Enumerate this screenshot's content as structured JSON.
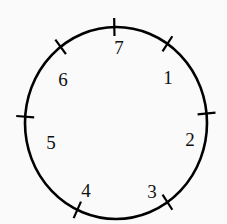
{
  "figure": {
    "type": "labeled-circle-diagram",
    "background_color": "#fafafa",
    "stroke_color": "#000000",
    "label_color": "#101010",
    "circle": {
      "center_x": 116,
      "center_y": 123,
      "radius_x": 91,
      "radius_y": 96,
      "stroke_width": 2.6
    },
    "tick": {
      "inner_offset": -9,
      "outer_offset": 9,
      "stroke_width": 2.2
    },
    "label_inset": 26,
    "marks": [
      {
        "id": "mark-1",
        "label": "1",
        "angle_deg": 57,
        "label_x": 168,
        "label_y": 77
      },
      {
        "id": "mark-2",
        "label": "2",
        "angle_deg": 6,
        "label_x": 190,
        "label_y": 139
      },
      {
        "id": "mark-3",
        "label": "3",
        "angle_deg": -57,
        "label_x": 152,
        "label_y": 191
      },
      {
        "id": "mark-4",
        "label": "4",
        "angle_deg": -114,
        "label_x": 86,
        "label_y": 190
      },
      {
        "id": "mark-5",
        "label": "5",
        "angle_deg": 176,
        "label_x": 51,
        "label_y": 142
      },
      {
        "id": "mark-6",
        "label": "6",
        "angle_deg": 126,
        "label_x": 63,
        "label_y": 79
      },
      {
        "id": "mark-7",
        "label": "7",
        "angle_deg": 91,
        "label_x": 119,
        "label_y": 47
      }
    ]
  }
}
